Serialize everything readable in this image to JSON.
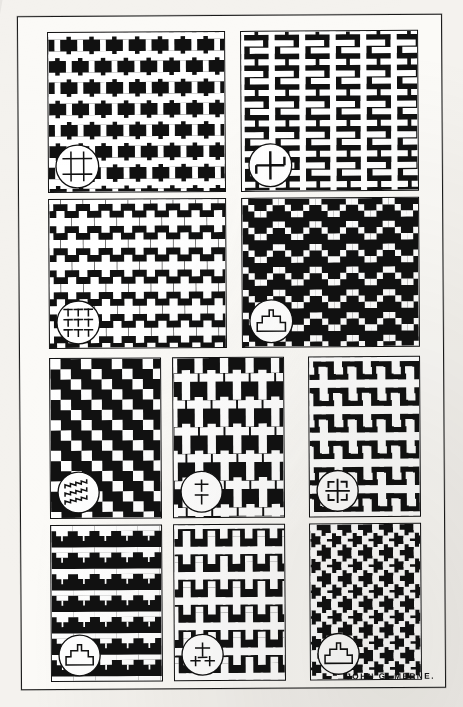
{
  "plate": {
    "title": "Geometric Ornament Plate",
    "signature": "JOHN G. MERNE.",
    "background_color": "#f4f2ee",
    "ink_color": "#111111",
    "paper_color": "#fbfaf7",
    "frame": {
      "x": 19,
      "y": 15,
      "width": 423,
      "height": 672,
      "stroke": "#1a1a1a"
    },
    "rows": [
      2,
      2,
      3,
      3
    ],
    "panel_count": 10
  },
  "panels": [
    {
      "index": 1,
      "name": "interlocking-i-beam-fret",
      "label": "Interlocking I-beam fret",
      "row": 1,
      "col": 1,
      "x": 29,
      "y": 15,
      "width": 176,
      "height": 159,
      "pattern": "ibeam",
      "unit": 22,
      "motif": {
        "name": "ibeam-key-motif",
        "glyph": "H",
        "cx": 28,
        "cy": 131,
        "r": 21
      }
    },
    {
      "index": 2,
      "name": "meander-fylfot-fret",
      "label": "Meander fylfot fret",
      "row": 1,
      "col": 2,
      "x": 222,
      "y": 15,
      "width": 176,
      "height": 159,
      "pattern": "swastika",
      "unit": 30,
      "motif": {
        "name": "fylfot-key-motif",
        "glyph": "fylfot",
        "cx": 28,
        "cy": 131,
        "r": 21
      }
    },
    {
      "index": 3,
      "name": "interlocking-greek-cross",
      "label": "Interlocking Greek cross",
      "row": 2,
      "col": 1,
      "x": 29,
      "y": 182,
      "width": 176,
      "height": 148,
      "pattern": "cross",
      "unit": 27,
      "motif": {
        "name": "tee-cluster-key-motif",
        "glyph": "tee-cluster",
        "cx": 28,
        "cy": 120,
        "r": 21
      }
    },
    {
      "index": 4,
      "name": "stepped-chevron",
      "label": "Stepped chevron",
      "row": 2,
      "col": 2,
      "x": 222,
      "y": 182,
      "width": 176,
      "height": 148,
      "pattern": "chevron",
      "unit": 36,
      "motif": {
        "name": "stepped-pyramid-key-motif",
        "glyph": "step-pyramid",
        "cx": 28,
        "cy": 120,
        "r": 21
      }
    },
    {
      "index": 5,
      "name": "diagonal-stepped-bands",
      "label": "Diagonal stepped bands",
      "row": 3,
      "col": 1,
      "x": 29,
      "y": 341,
      "width": 110,
      "height": 159,
      "pattern": "diagonal",
      "unit": 10,
      "motif": {
        "name": "stepped-line-key-motif",
        "glyph": "step-lines",
        "cx": 27,
        "cy": 131,
        "r": 20
      }
    },
    {
      "index": 6,
      "name": "latin-cross-diaper",
      "label": "Latin cross diaper",
      "row": 3,
      "col": 2,
      "x": 152,
      "y": 341,
      "width": 110,
      "height": 159,
      "pattern": "latincross",
      "unit": 31,
      "motif": {
        "name": "latin-cross-key-motif",
        "glyph": "latin-cross",
        "cx": 27,
        "cy": 131,
        "r": 20
      }
    },
    {
      "index": 7,
      "name": "labyrinth-cross-fret",
      "label": "Labyrinth cross fret",
      "row": 3,
      "col": 3,
      "x": 288,
      "y": 341,
      "width": 110,
      "height": 159,
      "pattern": "keycross",
      "unit": 36,
      "motif": {
        "name": "labyrinth-cross-key-motif",
        "glyph": "labyrinth-cross",
        "cx": 27,
        "cy": 131,
        "r": 20
      }
    },
    {
      "index": 8,
      "name": "stepped-pyramid-rows",
      "label": "Stepped pyramid rows",
      "row": 4,
      "col": 1,
      "x": 29,
      "y": 508,
      "width": 110,
      "height": 155,
      "pattern": "pyramid",
      "unit": 34,
      "motif": {
        "name": "stepped-dome-key-motif",
        "glyph": "step-dome",
        "cx": 27,
        "cy": 127,
        "r": 20
      }
    },
    {
      "index": 9,
      "name": "compound-cross-diaper",
      "label": "Compound cross diaper",
      "row": 4,
      "col": 2,
      "x": 152,
      "y": 508,
      "width": 110,
      "height": 155,
      "pattern": "crossplus",
      "unit": 31,
      "motif": {
        "name": "compound-cross-key-motif",
        "glyph": "compound-cross",
        "cx": 27,
        "cy": 127,
        "r": 20
      }
    },
    {
      "index": 10,
      "name": "zigzag-stepped-lightning",
      "label": "Zigzag stepped lightning",
      "row": 4,
      "col": 3,
      "x": 288,
      "y": 508,
      "width": 110,
      "height": 155,
      "pattern": "lightning",
      "unit": 28,
      "motif": {
        "name": "stepped-arch-key-motif",
        "glyph": "step-arch",
        "cx": 27,
        "cy": 127,
        "r": 20
      }
    }
  ]
}
